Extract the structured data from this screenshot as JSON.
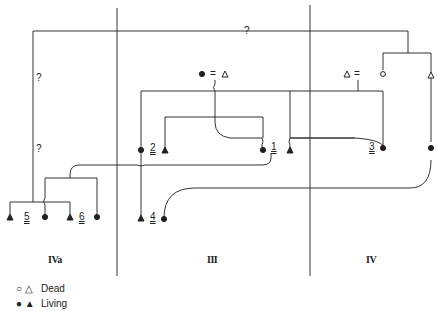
{
  "diagram": {
    "type": "kinship-genealogy",
    "columns": [
      {
        "id": "IVa",
        "label": "IVa"
      },
      {
        "id": "III",
        "label": "III"
      },
      {
        "id": "IV",
        "label": "IV"
      }
    ],
    "uncertain_marks": [
      "?",
      "?",
      "?"
    ],
    "individuals": [
      "1",
      "2",
      "3",
      "4",
      "5",
      "6"
    ],
    "couple_sign": "=",
    "colors": {
      "line": "#333333",
      "background": "#ffffff"
    }
  },
  "legend": {
    "dead": {
      "symbols": "○ △",
      "label": "Dead"
    },
    "living": {
      "symbols": "● ▲",
      "label": "Living"
    }
  }
}
